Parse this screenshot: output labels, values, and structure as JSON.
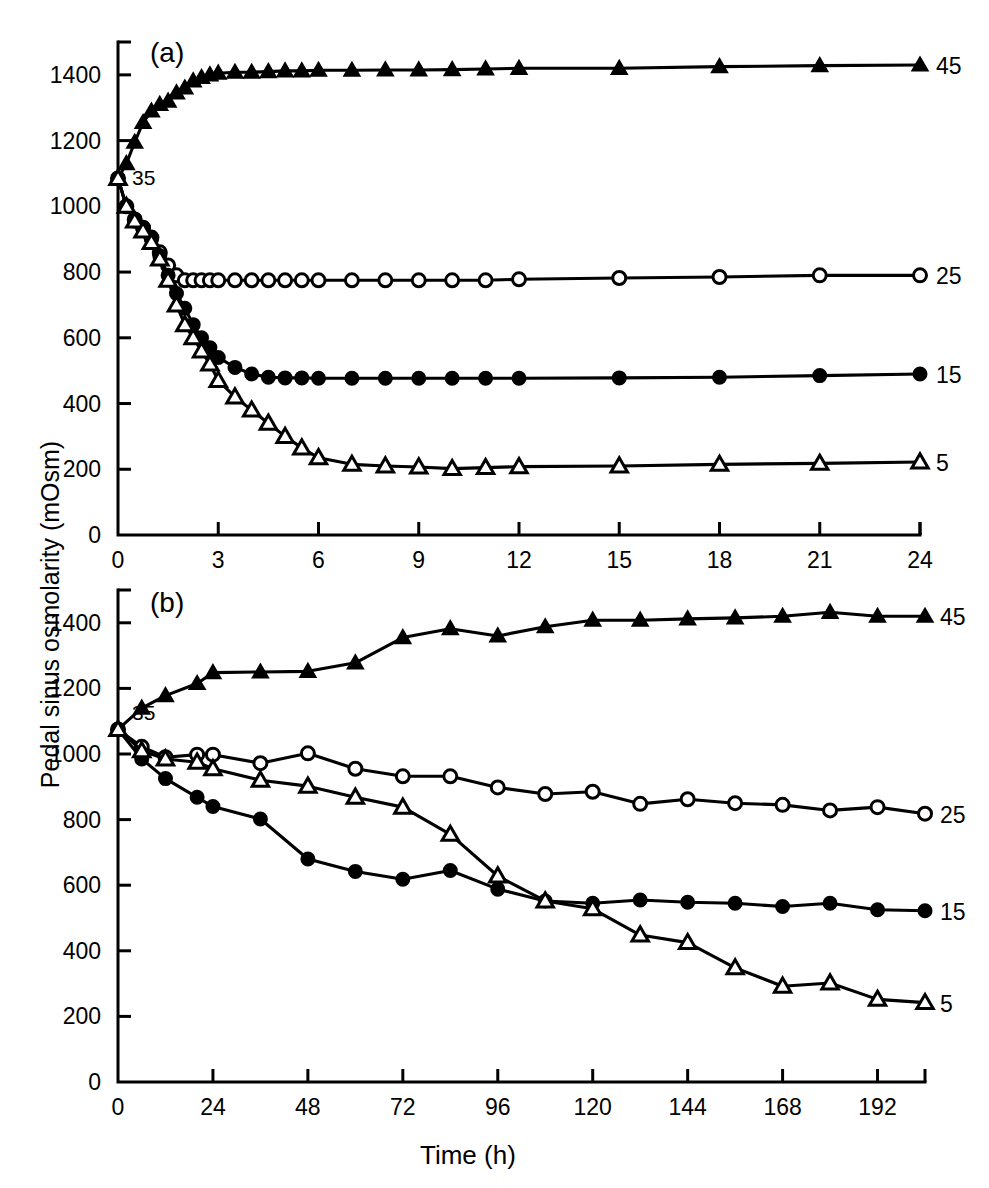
{
  "figure": {
    "ylabel": "Pedal sinus osmolarity (mOsm)",
    "xlabel": "Time (h)",
    "panel_a_label": "(a)",
    "panel_b_label": "(b)",
    "inline_annotation": "35",
    "series_labels": {
      "s45": "45",
      "s25": "25",
      "s15": "15",
      "s5": "5"
    },
    "colors": {
      "ink": "#000000",
      "paper": "#ffffff"
    }
  },
  "chart_data": [
    {
      "type": "line",
      "title": "(a)",
      "xlabel": "Time (h)",
      "ylabel": "Pedal sinus osmolarity (mOsm)",
      "xlim": [
        0,
        24
      ],
      "ylim": [
        0,
        1500
      ],
      "xticks": [
        0,
        3,
        6,
        9,
        12,
        15,
        18,
        21,
        24
      ],
      "yticks": [
        0,
        200,
        400,
        600,
        800,
        1000,
        1200,
        1400
      ],
      "grid": false,
      "legend_position": "right-of-line-ends",
      "annotations": [
        {
          "text": "35",
          "x": 0.55,
          "y": 1090,
          "note": "starting osmolarity group label"
        }
      ],
      "series": [
        {
          "name": "45",
          "marker": "filled-triangle",
          "x": [
            0,
            0.25,
            0.5,
            0.75,
            1.0,
            1.25,
            1.5,
            1.75,
            2.0,
            2.25,
            2.5,
            2.75,
            3.0,
            3.5,
            4.0,
            4.5,
            5.0,
            5.5,
            6.0,
            7.0,
            8.0,
            9.0,
            10.0,
            11.0,
            12.0,
            15.0,
            18.0,
            21.0,
            24.0
          ],
          "y": [
            1085,
            1130,
            1195,
            1255,
            1290,
            1310,
            1320,
            1345,
            1360,
            1382,
            1392,
            1400,
            1405,
            1408,
            1408,
            1410,
            1412,
            1412,
            1414,
            1414,
            1415,
            1415,
            1416,
            1418,
            1420,
            1420,
            1425,
            1428,
            1430
          ]
        },
        {
          "name": "25",
          "marker": "open-circle",
          "x": [
            0,
            0.25,
            0.5,
            0.75,
            1.0,
            1.25,
            1.5,
            1.75,
            2.0,
            2.25,
            2.5,
            2.75,
            3.0,
            3.5,
            4.0,
            4.5,
            5.0,
            5.5,
            6.0,
            7.0,
            8.0,
            9.0,
            10.0,
            11.0,
            12.0,
            15.0,
            18.0,
            21.0,
            24.0
          ],
          "y": [
            1085,
            1000,
            960,
            935,
            905,
            860,
            820,
            790,
            775,
            775,
            775,
            775,
            775,
            775,
            775,
            775,
            775,
            775,
            775,
            775,
            775,
            775,
            775,
            775,
            778,
            782,
            785,
            790,
            790
          ]
        },
        {
          "name": "15",
          "marker": "filled-circle",
          "x": [
            0,
            0.25,
            0.5,
            0.75,
            1.0,
            1.25,
            1.5,
            1.75,
            2.0,
            2.25,
            2.5,
            2.75,
            3.0,
            3.5,
            4.0,
            4.5,
            5.0,
            5.5,
            6.0,
            7.0,
            8.0,
            9.0,
            10.0,
            11.0,
            12.0,
            15.0,
            18.0,
            21.0,
            24.0
          ],
          "y": [
            1085,
            1000,
            955,
            930,
            900,
            850,
            790,
            735,
            690,
            640,
            600,
            570,
            540,
            510,
            490,
            480,
            478,
            478,
            477,
            477,
            477,
            477,
            477,
            477,
            477,
            478,
            480,
            485,
            490
          ]
        },
        {
          "name": "5",
          "marker": "open-triangle",
          "x": [
            0,
            0.25,
            0.5,
            0.75,
            1.0,
            1.25,
            1.5,
            1.75,
            2.0,
            2.25,
            2.5,
            2.75,
            3.0,
            3.5,
            4.0,
            4.5,
            5.0,
            5.5,
            6.0,
            7.0,
            8.0,
            9.0,
            10.0,
            11.0,
            12.0,
            15.0,
            18.0,
            21.0,
            24.0
          ],
          "y": [
            1085,
            1000,
            955,
            925,
            890,
            840,
            775,
            700,
            640,
            600,
            560,
            520,
            470,
            420,
            380,
            340,
            300,
            265,
            235,
            215,
            210,
            207,
            202,
            205,
            208,
            210,
            215,
            218,
            222
          ]
        }
      ]
    },
    {
      "type": "line",
      "title": "(b)",
      "xlabel": "Time (h)",
      "ylabel": "Pedal sinus osmolarity (mOsm)",
      "xlim": [
        0,
        204
      ],
      "ylim": [
        0,
        1500
      ],
      "xticks": [
        0,
        24,
        48,
        72,
        96,
        120,
        144,
        168,
        192
      ],
      "yticks": [
        0,
        200,
        400,
        600,
        800,
        1000,
        1200,
        1400
      ],
      "grid": false,
      "legend_position": "right-of-line-ends",
      "annotations": [
        {
          "text": "35",
          "x": 5,
          "y": 1085,
          "note": "starting osmolarity group label"
        }
      ],
      "series": [
        {
          "name": "45",
          "marker": "filled-triangle",
          "x": [
            0,
            6,
            12,
            20,
            24,
            36,
            48,
            60,
            72,
            84,
            96,
            108,
            120,
            132,
            144,
            156,
            168,
            180,
            192,
            204
          ],
          "y": [
            1075,
            1140,
            1178,
            1215,
            1248,
            1250,
            1252,
            1278,
            1355,
            1382,
            1360,
            1388,
            1408,
            1408,
            1412,
            1415,
            1420,
            1432,
            1420,
            1420
          ]
        },
        {
          "name": "25",
          "marker": "open-circle",
          "x": [
            0,
            6,
            12,
            20,
            24,
            36,
            48,
            60,
            72,
            84,
            96,
            108,
            120,
            132,
            144,
            156,
            168,
            180,
            192,
            204
          ],
          "y": [
            1075,
            1022,
            990,
            998,
            998,
            972,
            1002,
            955,
            932,
            932,
            898,
            878,
            885,
            848,
            862,
            850,
            845,
            828,
            838,
            818
          ]
        },
        {
          "name": "15",
          "marker": "filled-circle",
          "x": [
            0,
            6,
            12,
            20,
            24,
            36,
            48,
            60,
            72,
            84,
            96,
            108,
            120,
            132,
            144,
            156,
            168,
            180,
            192,
            204
          ],
          "y": [
            1075,
            985,
            925,
            868,
            840,
            802,
            680,
            642,
            618,
            645,
            588,
            552,
            545,
            555,
            548,
            545,
            535,
            545,
            525,
            522
          ]
        },
        {
          "name": "5",
          "marker": "open-triangle",
          "x": [
            0,
            6,
            12,
            20,
            24,
            36,
            48,
            60,
            72,
            84,
            96,
            108,
            120,
            132,
            144,
            156,
            168,
            180,
            192,
            204
          ],
          "y": [
            1075,
            1010,
            985,
            975,
            955,
            920,
            902,
            868,
            838,
            755,
            628,
            552,
            528,
            448,
            425,
            348,
            292,
            302,
            252,
            242
          ]
        }
      ]
    }
  ]
}
